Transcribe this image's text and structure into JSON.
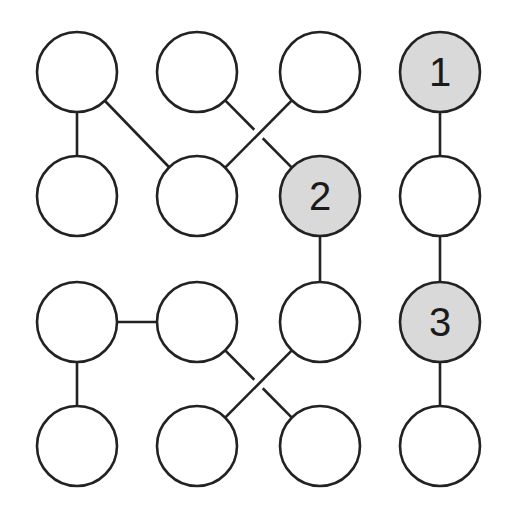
{
  "diagram": {
    "type": "graph",
    "grid": {
      "rows": 4,
      "cols": 4
    },
    "colors": {
      "stroke": "#222222",
      "highlight_fill": "#d9d9d9",
      "default_fill": "#ffffff"
    },
    "column_x": [
      77,
      197,
      320,
      440
    ],
    "row_y": [
      72,
      196,
      322,
      446
    ],
    "radius": 40,
    "nodes": [
      {
        "id": "n00",
        "row": 0,
        "col": 0,
        "label": "",
        "highlighted": false
      },
      {
        "id": "n01",
        "row": 0,
        "col": 1,
        "label": "",
        "highlighted": false
      },
      {
        "id": "n02",
        "row": 0,
        "col": 2,
        "label": "",
        "highlighted": false
      },
      {
        "id": "n03",
        "row": 0,
        "col": 3,
        "label": "1",
        "highlighted": true
      },
      {
        "id": "n10",
        "row": 1,
        "col": 0,
        "label": "",
        "highlighted": false
      },
      {
        "id": "n11",
        "row": 1,
        "col": 1,
        "label": "",
        "highlighted": false
      },
      {
        "id": "n12",
        "row": 1,
        "col": 2,
        "label": "2",
        "highlighted": true
      },
      {
        "id": "n13",
        "row": 1,
        "col": 3,
        "label": "",
        "highlighted": false
      },
      {
        "id": "n20",
        "row": 2,
        "col": 0,
        "label": "",
        "highlighted": false
      },
      {
        "id": "n21",
        "row": 2,
        "col": 1,
        "label": "",
        "highlighted": false
      },
      {
        "id": "n22",
        "row": 2,
        "col": 2,
        "label": "",
        "highlighted": false
      },
      {
        "id": "n23",
        "row": 2,
        "col": 3,
        "label": "3",
        "highlighted": true
      },
      {
        "id": "n30",
        "row": 3,
        "col": 0,
        "label": "",
        "highlighted": false
      },
      {
        "id": "n31",
        "row": 3,
        "col": 1,
        "label": "",
        "highlighted": false
      },
      {
        "id": "n32",
        "row": 3,
        "col": 2,
        "label": "",
        "highlighted": false
      },
      {
        "id": "n33",
        "row": 3,
        "col": 3,
        "label": "",
        "highlighted": false
      }
    ],
    "edges": [
      {
        "from": "n00",
        "to": "n10",
        "crossing_gap": false
      },
      {
        "from": "n00",
        "to": "n11",
        "crossing_gap": false
      },
      {
        "from": "n01",
        "to": "n12",
        "crossing_gap": true
      },
      {
        "from": "n02",
        "to": "n11",
        "crossing_gap": false
      },
      {
        "from": "n03",
        "to": "n13",
        "crossing_gap": false
      },
      {
        "from": "n12",
        "to": "n22",
        "crossing_gap": false
      },
      {
        "from": "n13",
        "to": "n23",
        "crossing_gap": false
      },
      {
        "from": "n20",
        "to": "n21",
        "crossing_gap": false
      },
      {
        "from": "n20",
        "to": "n30",
        "crossing_gap": false
      },
      {
        "from": "n21",
        "to": "n32",
        "crossing_gap": true
      },
      {
        "from": "n22",
        "to": "n31",
        "crossing_gap": false
      },
      {
        "from": "n23",
        "to": "n33",
        "crossing_gap": false
      }
    ]
  }
}
